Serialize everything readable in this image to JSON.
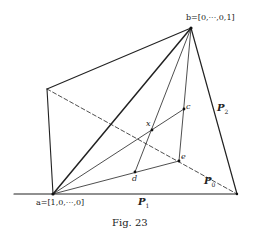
{
  "figure": {
    "caption": "Fig. 23",
    "labels": {
      "b": "b=[0,···,0,1]",
      "a": "a=[1,0,···,0]",
      "c": "c",
      "x": "x",
      "d": "d",
      "e": "e",
      "P0": "P",
      "P0_sub": "0",
      "P1": "P",
      "P1_sub": "1",
      "P2": "P",
      "P2_sub": "2"
    },
    "points": {
      "a": [
        53,
        194
      ],
      "b": [
        191,
        28
      ],
      "left_corner": [
        47,
        89
      ],
      "right_corner": [
        237,
        194
      ],
      "c": [
        184,
        109
      ],
      "x": [
        152,
        130
      ],
      "e": [
        179,
        161
      ],
      "d": [
        135,
        172
      ]
    },
    "colors": {
      "line": "#222222",
      "background": "#ffffff"
    }
  }
}
